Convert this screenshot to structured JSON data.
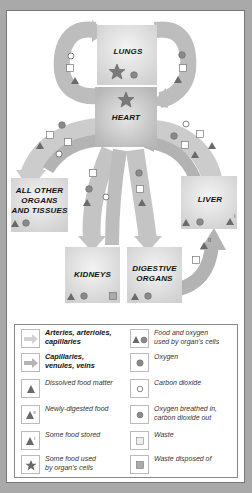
{
  "organs": {
    "lungs": "LUNGS",
    "heart": "HEART",
    "other": [
      "ALL OTHER",
      "ORGANS",
      "AND TISSUES"
    ],
    "liver": "LIVER",
    "kidneys": "KIDNEYS",
    "digestive": [
      "DIGESTIVE",
      "ORGANS"
    ]
  },
  "legend": {
    "arteries": [
      "Arteries, arterioles,",
      "capillaries"
    ],
    "veins": [
      "Capillaries,",
      "venules, veins"
    ],
    "dissolved_food": "Dissolved food matter",
    "newly_digested": "Newly-digested food",
    "food_stored": "Some food stored",
    "food_used": [
      "Some food used",
      "by organ's cells"
    ],
    "food_oxygen_used": [
      "Food and oxygen",
      "used by organ's cells"
    ],
    "oxygen": "Oxygen",
    "co2": "Carbon dioxide",
    "breathed": [
      "Oxygen breathed in,",
      "carbon dioxide out"
    ],
    "waste": "Waste",
    "waste_disposed": "Waste disposed of"
  },
  "colors": {
    "background": "#a9a9a9",
    "artery_arrow": "#cfcfcf",
    "vein_arrow": "#b5b5b5",
    "organ_box": "#dcdcdc",
    "symbol": "#6a6a6a"
  }
}
